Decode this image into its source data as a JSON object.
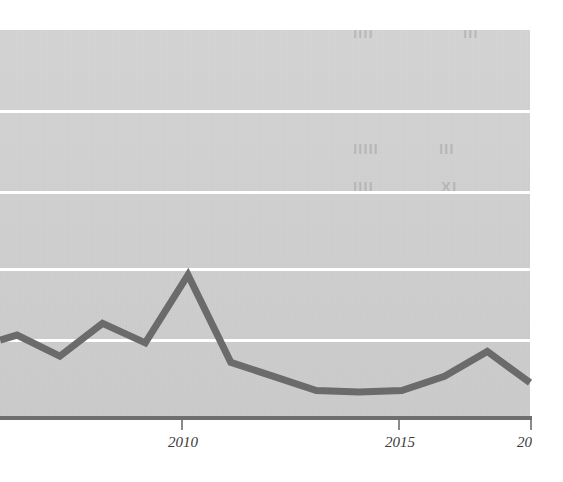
{
  "chart_data": {
    "type": "line",
    "title": "",
    "subtitle": "",
    "xlabel": "",
    "ylabel": "",
    "x": [
      2005,
      2006,
      2007,
      2008,
      2009,
      2010,
      2011,
      2012,
      2013,
      2014,
      2015,
      2016,
      2017
    ],
    "categories": [
      "2005",
      "2006",
      "2007",
      "2008",
      "2009",
      "2010",
      "2011",
      "2012",
      "2013",
      "2014",
      "2015",
      "2016",
      "2017"
    ],
    "series": [
      {
        "name": "series-1",
        "values": [
          1.05,
          0.78,
          1.2,
          0.95,
          1.82,
          0.7,
          0.52,
          0.34,
          0.32,
          0.34,
          0.52,
          0.84,
          0.44
        ]
      }
    ],
    "xlim": [
      2005,
      2017
    ],
    "ylim": [
      0,
      5
    ],
    "xticks": [
      2010,
      2015,
      2017
    ],
    "xtick_labels": [
      "2010",
      "2015",
      "2017"
    ],
    "yticks": [
      1,
      2,
      3,
      4,
      5
    ],
    "ytick_labels": [
      "",
      "",
      "",
      "",
      ""
    ],
    "grid": true,
    "grid_orientation": "horizontal",
    "legend": false,
    "legend_position": "none",
    "annotations": []
  },
  "chart": {
    "plot_background_color": "#d2d2d2",
    "gridline_color": "#ffffff",
    "axis_color": "#6e6e6e",
    "series_color": "#6b6b6b",
    "page_background_color": "#ffffff",
    "tick_label_color": "#3a3a3a"
  },
  "axis": {
    "x_tick_labels": [
      "2010",
      "2015",
      "2017"
    ]
  },
  "gridlines": {
    "count": 5
  },
  "bleed_through": {
    "note": "faint reversed text showing through from the other side of the printed page",
    "fragments": [
      "IIII",
      "III",
      "IIIII",
      "III",
      "IIII",
      "IX"
    ]
  }
}
